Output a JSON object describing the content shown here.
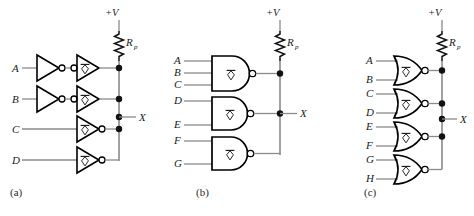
{
  "figure": {
    "background": "#ffffff",
    "wire_color": "#8a8a8a",
    "gate_color": "#000000",
    "dot_color": "#111111",
    "text_color": "#1a1a1a",
    "supply_label": "+V",
    "resistor_label": "R",
    "resistor_sub": "p",
    "output_label": "X"
  },
  "panels": [
    {
      "id": "a",
      "caption": "(a)",
      "gate_type": "inverter",
      "supply_label": "+V",
      "resistor_label": "R",
      "resistor_sub": "p",
      "output_label": "X",
      "inputs": [
        "A",
        "B",
        "C",
        "D"
      ],
      "stages": [
        {
          "input": "A",
          "first_stage": "inverter",
          "second_stage": "inverter-input-bubble"
        },
        {
          "input": "B",
          "first_stage": "inverter",
          "second_stage": "inverter-input-bubble"
        },
        {
          "input": "C",
          "first_stage": "none",
          "second_stage": "inverter-output-bubble"
        },
        {
          "input": "D",
          "first_stage": "none",
          "second_stage": "inverter-output-bubble"
        }
      ],
      "bus_dots": 4
    },
    {
      "id": "b",
      "caption": "(b)",
      "gate_type": "nand",
      "supply_label": "+V",
      "resistor_label": "R",
      "resistor_sub": "p",
      "output_label": "X",
      "inputs": [
        "A",
        "B",
        "C",
        "D",
        "E",
        "F",
        "G"
      ],
      "gates": [
        {
          "inputs": [
            "A",
            "B",
            "C"
          ],
          "type": "nand-3"
        },
        {
          "inputs": [
            "D",
            "E"
          ],
          "type": "nand-2"
        },
        {
          "inputs": [
            "F",
            "G"
          ],
          "type": "nand-2"
        }
      ],
      "bus_dots": 2
    },
    {
      "id": "c",
      "caption": "(c)",
      "gate_type": "nor",
      "supply_label": "+V",
      "resistor_label": "R",
      "resistor_sub": "p",
      "output_label": "X",
      "inputs": [
        "A",
        "B",
        "C",
        "D",
        "E",
        "F",
        "G",
        "H"
      ],
      "gates": [
        {
          "inputs": [
            "A",
            "B"
          ],
          "type": "nor-2"
        },
        {
          "inputs": [
            "C",
            "D"
          ],
          "type": "nor-2"
        },
        {
          "inputs": [
            "E",
            "F"
          ],
          "type": "nor-2"
        },
        {
          "inputs": [
            "G",
            "H"
          ],
          "type": "nor-2"
        }
      ],
      "bus_dots": 4
    }
  ]
}
